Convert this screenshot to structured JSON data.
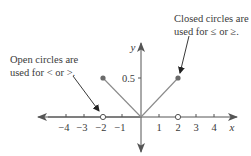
{
  "diagram": {
    "title": "",
    "annotations": {
      "open_circles": {
        "line1": "Open circles are",
        "line2": "used for < or >."
      },
      "closed_circles": {
        "line1": "Closed circles are",
        "line2": "used for ≤ or ≥."
      }
    },
    "axes": {
      "x_label": "x",
      "y_label": "y",
      "x_ticks": [
        "−4",
        "−3",
        "−2",
        "−1",
        "1",
        "2",
        "3",
        "4"
      ],
      "y_ticks": [
        "0.5"
      ]
    },
    "points": {
      "closed": [
        {
          "x": -2,
          "y": 0.5
        },
        {
          "x": 2,
          "y": 0.5
        }
      ],
      "open": [
        {
          "x": -2,
          "y": 0
        },
        {
          "x": 2,
          "y": 0
        }
      ]
    },
    "segments": [
      {
        "from": [
          -2,
          0.5
        ],
        "to": [
          0,
          0
        ]
      },
      {
        "from": [
          0,
          0
        ],
        "to": [
          2,
          0.5
        ]
      }
    ],
    "colors": {
      "axis": "#555555",
      "graph_line": "#8a8a8a",
      "point": "#6a6a6a",
      "text": "#3a3a3a"
    }
  }
}
